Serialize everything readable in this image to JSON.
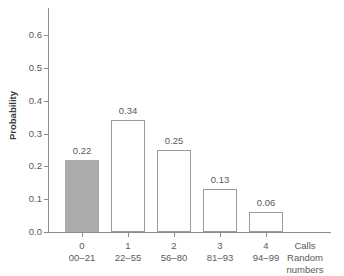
{
  "chart_data": {
    "type": "bar",
    "title": "",
    "subtitle": "",
    "xlabel": "Calls / Random numbers",
    "ylabel": "Probability",
    "ylim": [
      0.0,
      0.6
    ],
    "yticks": [
      "0.0",
      "0.1",
      "0.2",
      "0.3",
      "0.4",
      "0.5",
      "0.6"
    ],
    "ytick_values": [
      0.0,
      0.1,
      0.2,
      0.3,
      0.4,
      0.5,
      0.6
    ],
    "grid": false,
    "legend": "none",
    "categories": [
      "0",
      "1",
      "2",
      "3",
      "4"
    ],
    "category_sublabels": [
      "00–21",
      "22–55",
      "56–80",
      "81–93",
      "94–99"
    ],
    "values": [
      0.22,
      0.34,
      0.25,
      0.13,
      0.06
    ],
    "value_labels": [
      "0.22",
      "0.34",
      "0.25",
      "0.13",
      "0.06"
    ],
    "bar_fill_states": [
      "filled",
      "empty",
      "empty",
      "empty",
      "empty"
    ],
    "colors": {
      "filled_bar": "#ababab",
      "empty_bar_fill": "#ffffff",
      "bar_outline": "#9a9a9a",
      "axis": "#8c8c8c",
      "text": "#5a5a5a",
      "background": "#ffffff"
    }
  },
  "axis_caption": {
    "line1": "Calls",
    "line2": "Random",
    "line3": "numbers"
  }
}
